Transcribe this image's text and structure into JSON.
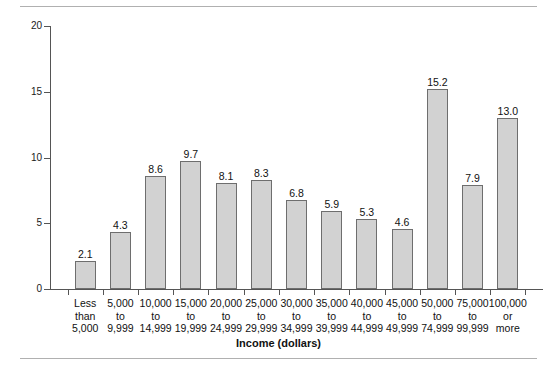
{
  "chart_data": {
    "type": "bar",
    "title": "",
    "xlabel": "Income (dollars)",
    "ylabel": "Percent",
    "ylim": [
      0,
      20
    ],
    "yticks": [
      0,
      5,
      10,
      15,
      20
    ],
    "grid": false,
    "legend": null,
    "categories": [
      "Less than 5,000",
      "5,000 to 9,999",
      "10,000 to 14,999",
      "15,000 to 19,999",
      "20,000 to 24,999",
      "25,000 to 29,999",
      "30,000 to 34,999",
      "35,000 to 39,999",
      "40,000 to 44,999",
      "45,000 to 49,999",
      "50,000 to 74,999",
      "75,000 to 99,999",
      "100,000 or more"
    ],
    "category_lines": [
      [
        "Less",
        "than",
        "5,000"
      ],
      [
        "5,000",
        "to",
        "9,999"
      ],
      [
        "10,000",
        "to",
        "14,999"
      ],
      [
        "15,000",
        "to",
        "19,999"
      ],
      [
        "20,000",
        "to",
        "24,999"
      ],
      [
        "25,000",
        "to",
        "29,999"
      ],
      [
        "30,000",
        "to",
        "34,999"
      ],
      [
        "35,000",
        "to",
        "39,999"
      ],
      [
        "40,000",
        "to",
        "44,999"
      ],
      [
        "45,000",
        "to",
        "49,999"
      ],
      [
        "50,000",
        "to",
        "74,999"
      ],
      [
        "75,000",
        "to",
        "99,999"
      ],
      [
        "100,000",
        "or",
        "more"
      ]
    ],
    "values": [
      2.1,
      4.3,
      8.6,
      9.7,
      8.1,
      8.3,
      6.8,
      5.9,
      5.3,
      4.6,
      15.2,
      7.9,
      13.0
    ],
    "value_labels": [
      "2.1",
      "4.3",
      "8.6",
      "9.7",
      "8.1",
      "8.3",
      "6.8",
      "5.9",
      "5.3",
      "4.6",
      "15.2",
      "7.9",
      "13.0"
    ],
    "colors": {
      "bar_fill": "#d2d2d2",
      "bar_edge": "#6e6e6e",
      "axis": "#555555",
      "text": "#111111",
      "rule": "#b0b0b0",
      "background": "#ffffff"
    }
  }
}
